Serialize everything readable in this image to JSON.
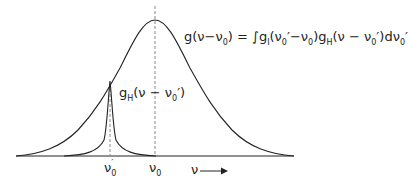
{
  "diagram": {
    "type": "line-profile-convolution",
    "curves": [
      {
        "name": "broad-profile",
        "label": "g(ν−ν₀) = ∫g_I(ν₀′−ν₀) g_H(ν−ν₀′) dν₀′",
        "peak_x": "ν₀"
      },
      {
        "name": "narrow-profile",
        "label": "g_H(ν−ν₀′)",
        "peak_x": "ν₀′"
      }
    ],
    "axis": {
      "tick_labels": [
        "ν₀′",
        "ν₀"
      ],
      "arrow_label": "ν"
    },
    "colors": {
      "line": "#222222",
      "dash": "#888888"
    }
  },
  "labels": {
    "broad_g": "g",
    "broad_arg_open": "(ν−ν",
    "broad_arg_sub": "0",
    "broad_arg_close": ")",
    "equals_int": " = ∫",
    "gI": "g",
    "gI_sub": "I",
    "gI_arg_a": "(ν",
    "gI_arg_a_sub": "0",
    "gI_arg_b": "′−ν",
    "gI_arg_b_sub": "0",
    "gI_arg_close": ")",
    "gH": "g",
    "gH_sub": "H",
    "gH_arg_a": "(ν − ν",
    "gH_arg_a_sub": "0",
    "gH_arg_close": "′)dν",
    "d_sub": "0",
    "d_prime": "′",
    "narrow_g": "g",
    "narrow_sub": "H",
    "narrow_arg": "(ν − ν",
    "narrow_arg_sub": "0",
    "narrow_close": "′)",
    "tick1_main": "ν",
    "tick1_sub": "0",
    "tick1_prime": "′",
    "tick2_main": "ν",
    "tick2_sub": "0",
    "axis_nu": "ν"
  }
}
